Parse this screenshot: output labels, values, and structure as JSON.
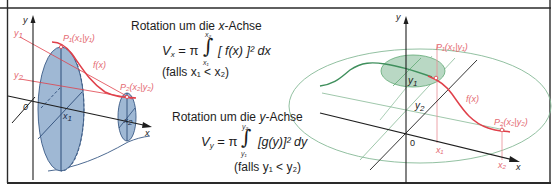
{
  "colors": {
    "frame": "#2a2a2a",
    "axis": "#1e1e1e",
    "curve_red": "#e0404a",
    "label_red": "#e46a72",
    "blue_fill": "#9fb8d4",
    "blue_stroke": "#3a5a86",
    "green_fill": "#b9d8c4",
    "green_stroke": "#5fa874",
    "green_curve": "#3f8f5c",
    "thin_green": "#86b996"
  },
  "left_diagram": {
    "axis_y_label": "y",
    "axis_x_label": "x",
    "origin_label": "0",
    "y1_label": "y",
    "y1_sub": "1",
    "y2_label": "y",
    "y2_sub": "2",
    "p1_label": "P₁(x₁|y₁)",
    "p2_label": "P₂(x₂|y₂)",
    "curve_label": "f(x)",
    "x1_label": "x",
    "x1_sub": "1",
    "x2_label": "x",
    "x2_sub": "2"
  },
  "formula_x": {
    "title_prefix": "Rotation um die ",
    "title_var": "x",
    "title_suffix": "-Achse",
    "lhs_var": "V",
    "lhs_sub": "x",
    "equals_pi": "= π",
    "integral_sign": "∫",
    "upper_limit": "x₂",
    "lower_limit": "x₁",
    "integrand": "[ f(x) ]² dx",
    "condition": "(falls x₁ < x₂)"
  },
  "formula_y": {
    "title_prefix": "Rotation um die ",
    "title_var": "y",
    "title_suffix": "-Achse",
    "lhs_var": "V",
    "lhs_sub": "y",
    "equals_pi": "= π",
    "integral_sign": "∫",
    "upper_limit": "y₂",
    "lower_limit": "y₁",
    "integrand": "[g(y)]² dy",
    "condition": "(falls y₁ < y₂)"
  },
  "right_diagram": {
    "axis_y_label": "y",
    "axis_x_label": "x",
    "origin_label": "0",
    "y1_label": "y",
    "y1_sub": "1",
    "y2_label": "y",
    "y2_sub": "2",
    "p1_label": "P₁(x₁|y₁)",
    "p2_label": "P₂(x₂|y₂)",
    "curve_label": "f(x)",
    "x1_label": "x₁",
    "x2_label": "x₂"
  }
}
